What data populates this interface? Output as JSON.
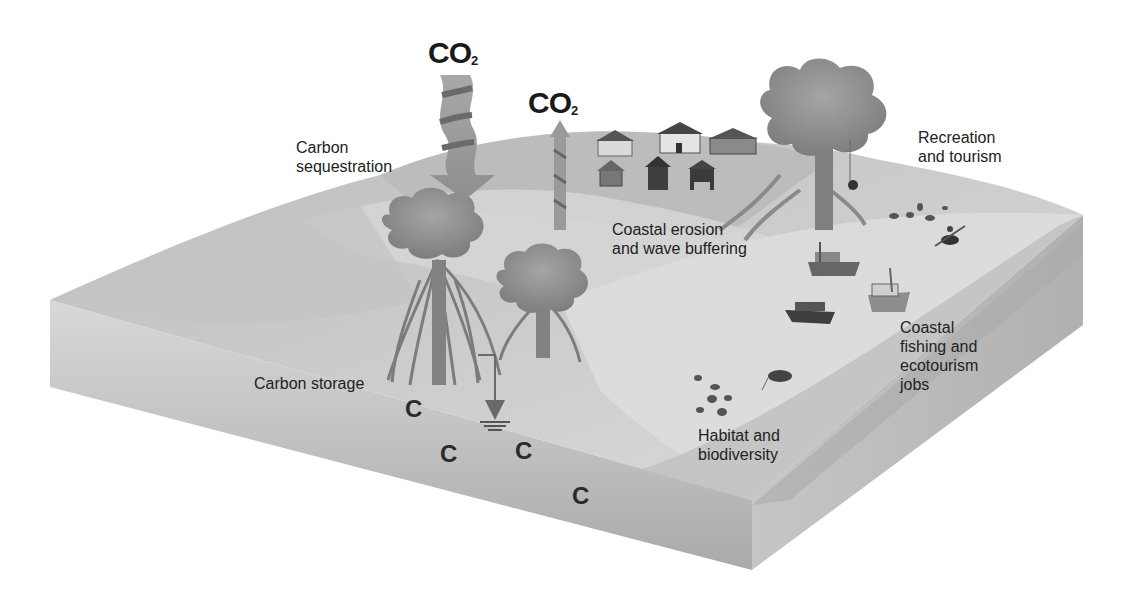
{
  "diagram": {
    "type": "block-diagram",
    "flows": {
      "co2_in": {
        "text": "CO",
        "sub": "2"
      },
      "co2_out": {
        "text": "CO",
        "sub": "2"
      }
    },
    "labels": {
      "carbon_sequestration": [
        "Carbon",
        "sequestration"
      ],
      "recreation_tourism": [
        "Recreation",
        "and tourism"
      ],
      "coastal_erosion": [
        "Coastal erosion",
        "and wave buffering"
      ],
      "coastal_fishing": [
        "Coastal",
        "fishing and",
        "ecotourism",
        "jobs"
      ],
      "carbon_storage": [
        "Carbon storage"
      ],
      "habitat_biodiversity": [
        "Habitat and",
        "biodiversity"
      ]
    },
    "carbon_symbols": [
      "C",
      "C",
      "C",
      "C"
    ],
    "colors": {
      "top_surface": "#cfcfcf",
      "hill": "#bdbdbd",
      "side_face": "#b4b4b4",
      "front_face": "#bcbcbc",
      "tree_canopy": "#8c8c8c",
      "tree_trunk": "#808080",
      "text": "#222222"
    }
  }
}
